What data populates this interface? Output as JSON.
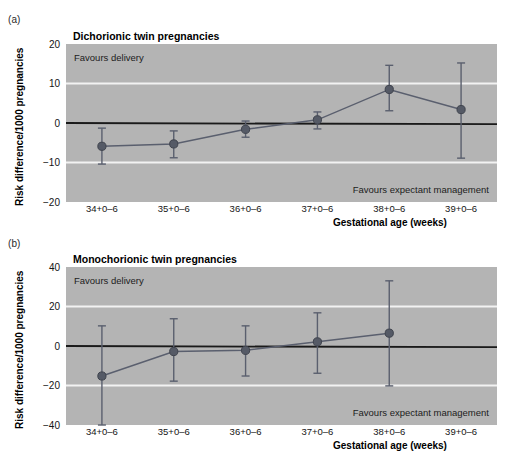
{
  "figure": {
    "background": "#ffffff",
    "plot_background": "#b4b4b4",
    "gridline_color": "#f2f2f2",
    "zero_line_color": "#1a1a1a",
    "series_color": "#5a5f6e",
    "marker_color": "#555a66"
  },
  "panels": [
    {
      "tag": "(a)",
      "title": "Dichorionic twin pregnancies",
      "y_axis_title": "Risk difference/1000 pregnancies",
      "x_axis_title": "Gestational age (weeks)",
      "note_top": "Favours delivery",
      "note_bottom": "Favours expectant management",
      "chart_data": {
        "type": "line",
        "title": "Dichorionic twin pregnancies",
        "xlabel": "Gestational age (weeks)",
        "ylabel": "Risk difference/1000 pregnancies",
        "categories": [
          "34+0–6",
          "35+0–6",
          "36+0–6",
          "37+0–6",
          "38+0–6",
          "39+0–6"
        ],
        "ylim": [
          -20,
          20
        ],
        "yticks": [
          20,
          10,
          0,
          -10,
          -20
        ],
        "ytick_labels": [
          "20",
          "10",
          "0",
          "−10",
          "−20"
        ],
        "gridlines_at": [
          10,
          -10
        ],
        "zero_reference_line": 0,
        "grid": true,
        "legend": "none",
        "series": [
          {
            "name": "Risk difference",
            "values": [
              -5.9,
              -5.3,
              -1.6,
              0.8,
              8.5,
              3.4
            ],
            "ci_lower": [
              -10.4,
              -8.8,
              -3.6,
              -1.5,
              3.1,
              -8.9
            ],
            "ci_upper": [
              -1.3,
              -2.0,
              0.5,
              2.8,
              14.6,
              15.2
            ]
          }
        ]
      }
    },
    {
      "tag": "(b)",
      "title": "Monochorionic twin pregnancies",
      "y_axis_title": "Risk difference/1000 pregnancies",
      "x_axis_title": "Gestational age (weeks)",
      "note_top": "Favours delivery",
      "note_bottom": "Favours expectant management",
      "chart_data": {
        "type": "line",
        "title": "Monochorionic twin pregnancies",
        "xlabel": "Gestational age (weeks)",
        "ylabel": "Risk difference/1000 pregnancies",
        "categories": [
          "34+0–6",
          "35+0–6",
          "36+0–6",
          "37+0–6",
          "38+0–6",
          "39+0–6"
        ],
        "ylim": [
          -40,
          40
        ],
        "yticks": [
          40,
          20,
          0,
          -20,
          -40
        ],
        "ytick_labels": [
          "40",
          "20",
          "0",
          "−20",
          "−40"
        ],
        "gridlines_at": [
          20,
          -20
        ],
        "zero_reference_line": 0,
        "grid": true,
        "legend": "none",
        "series": [
          {
            "name": "Risk difference",
            "values": [
              -15.2,
              -2.8,
              -2.2,
              2.1,
              6.5,
              null
            ],
            "ci_lower": [
              -40.0,
              -17.8,
              -15.2,
              -13.8,
              -20.2,
              null
            ],
            "ci_upper": [
              10.2,
              13.8,
              10.2,
              16.8,
              33.0,
              null
            ]
          }
        ]
      }
    }
  ]
}
